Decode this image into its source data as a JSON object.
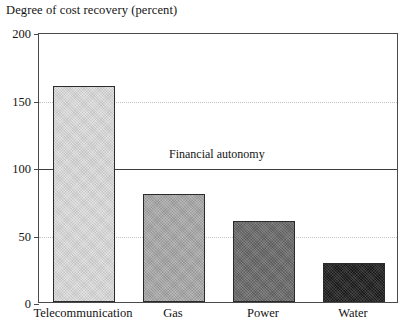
{
  "chart_data": {
    "type": "bar",
    "title": "Degree of cost recovery (percent)",
    "xlabel": "",
    "ylabel": "",
    "categories": [
      "Telecommunication",
      "Gas",
      "Power",
      "Water"
    ],
    "values": [
      160,
      80,
      60,
      29
    ],
    "series": [
      {
        "name": "Degree of cost recovery",
        "values": [
          160,
          80,
          60,
          29
        ]
      }
    ],
    "ylim": [
      0,
      200
    ],
    "yticks": [
      0,
      50,
      100,
      150,
      200
    ],
    "ytick_labels": [
      "0",
      "50",
      "100",
      "150",
      "200"
    ],
    "grid": true,
    "grid_axis": "y",
    "legend": "none",
    "annotations": [
      {
        "text": "Financial autonomy",
        "type": "reference-line",
        "value": 100
      }
    ],
    "bar_colors": [
      "#dcdcdc",
      "#a8a8a8",
      "#686868",
      "#1c1c1c"
    ],
    "bar_edge_color": "#2b2b2b"
  },
  "axis": {
    "y_tick_labels": [
      "200",
      "150",
      "100",
      "50",
      "0"
    ]
  },
  "colors": {
    "frame": "#4a4a4a",
    "grid": "#c2c2c2",
    "reference_line": "#3d3d3d",
    "text": "#141414",
    "background": "#ffffff"
  }
}
